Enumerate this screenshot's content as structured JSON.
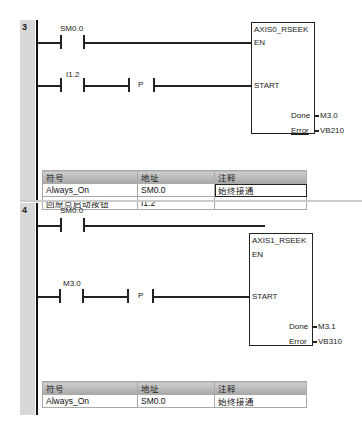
{
  "networks": [
    {
      "number": "3",
      "contacts": [
        {
          "address": "SM0.0",
          "type": "NO"
        },
        {
          "address": "I1.2",
          "type": "NO",
          "edge": "P"
        }
      ],
      "block": {
        "title": "AXIS0_RSEEK",
        "inputs": [
          "EN",
          "START"
        ],
        "outputs": [
          {
            "pin": "Done",
            "address": "M3.0"
          },
          {
            "pin": "Error",
            "address": "VB210"
          }
        ]
      },
      "symbol_table": {
        "headers": [
          "符号",
          "地址",
          "注释"
        ],
        "rows": [
          [
            "Always_On",
            "SM0.0",
            "始终接通"
          ],
          [
            "回原点启动按钮",
            "I1.2",
            ""
          ]
        ]
      }
    },
    {
      "number": "4",
      "contacts": [
        {
          "address": "SM0.0",
          "type": "NO"
        },
        {
          "address": "M3.0",
          "type": "NO",
          "edge": "P"
        }
      ],
      "block": {
        "title": "AXIS1_RSEEK",
        "inputs": [
          "EN",
          "START"
        ],
        "outputs": [
          {
            "pin": "Done",
            "address": "M3.1"
          },
          {
            "pin": "Error",
            "address": "VB310"
          }
        ]
      },
      "symbol_table": {
        "headers": [
          "符号",
          "地址",
          "注释"
        ],
        "rows": [
          [
            "Always_On",
            "SM0.0",
            "始终接通"
          ]
        ]
      }
    }
  ]
}
